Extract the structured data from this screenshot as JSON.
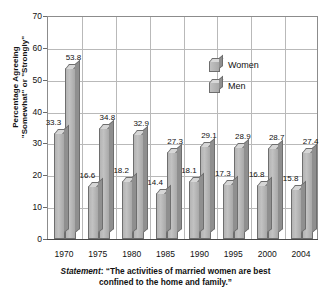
{
  "chart_data": {
    "type": "bar",
    "title": "",
    "subtitle": "",
    "xlabel": "",
    "ylabel": "Percentage Agreeing \"Somewhat\" or \"Strongly\"",
    "ylabel_lines": [
      "Percentage Agreeing",
      "\"Somewhat\" or \"Strongly\""
    ],
    "categories": [
      "1970",
      "1975",
      "1980",
      "1985",
      "1990",
      "1995",
      "2000",
      "2004"
    ],
    "series": [
      {
        "name": "Women",
        "values": [
          33.3,
          16.6,
          18.2,
          14.4,
          18.1,
          17.3,
          16.8,
          15.8
        ]
      },
      {
        "name": "Men",
        "values": [
          53.8,
          34.8,
          32.9,
          27.3,
          29.1,
          28.9,
          28.7,
          27.4
        ]
      }
    ],
    "ylim": [
      0,
      70
    ],
    "yticks": [
      0,
      10,
      20,
      30,
      40,
      50,
      60,
      70
    ],
    "ytick_labels": [
      "0",
      "10",
      "20",
      "30",
      "40",
      "50",
      "60",
      "70"
    ],
    "grid": true,
    "legend_position": "inside-top-center",
    "bar_color": "#b4b4b4",
    "bar_edge_color": "#6e6e6e",
    "grid_color": "#b9b9b9",
    "axis_color": "#4a4a4a"
  },
  "legend": {
    "items": [
      {
        "label": "Women"
      },
      {
        "label": "Men"
      }
    ]
  },
  "caption": {
    "prefix": "Statement",
    "separator": ": ",
    "text": "“The activities of married women are best confined to the home and family.”",
    "line1": "“The activities of married women are best",
    "line2": "confined to the home and family.”"
  }
}
